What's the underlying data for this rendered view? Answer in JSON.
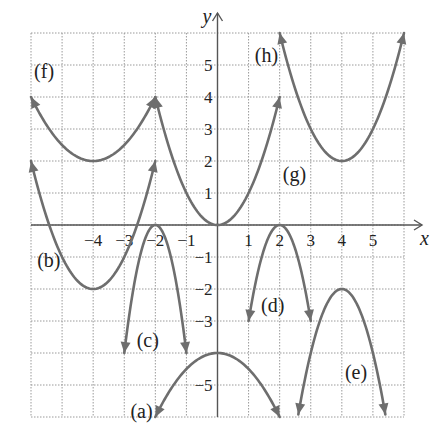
{
  "chart_data": {
    "type": "line",
    "title": "",
    "xlabel": "x",
    "ylabel": "y",
    "xlim": [
      -6,
      6
    ],
    "ylim": [
      -6,
      6
    ],
    "grid": true,
    "x_ticks": [
      "-4",
      "-3",
      "-2",
      "-1",
      "1",
      "2",
      "3",
      "4",
      "5"
    ],
    "x_tick_values": [
      -4,
      -3,
      -2,
      -1,
      1,
      2,
      3,
      4,
      5
    ],
    "y_ticks": [
      "5",
      "4",
      "3",
      "2",
      "1",
      "-1",
      "-2",
      "-3",
      "-5"
    ],
    "y_tick_values": [
      5,
      4,
      3,
      2,
      1,
      -1,
      -2,
      -3,
      -5
    ],
    "series": [
      {
        "name": "(a)",
        "vertex": [
          0,
          -4
        ],
        "a": -0.5,
        "h": 0,
        "k": -4,
        "x_range": [
          -2,
          2
        ],
        "label_pos": [
          -2.8,
          -5.8
        ]
      },
      {
        "name": "(b)",
        "vertex": [
          -4,
          -2
        ],
        "a": 1,
        "h": -4,
        "k": -2,
        "x_range": [
          -6,
          -2
        ],
        "label_pos": [
          -5.8,
          -1.1
        ]
      },
      {
        "name": "(c)",
        "vertex": [
          -2,
          0
        ],
        "a": -4,
        "h": -2,
        "k": 0,
        "x_range": [
          -3,
          -1
        ],
        "label_pos": [
          -2.6,
          -3.6
        ]
      },
      {
        "name": "(d)",
        "vertex": [
          2,
          0
        ],
        "a": -3,
        "h": 2,
        "k": 0,
        "x_range": [
          1,
          3
        ],
        "label_pos": [
          1.4,
          -2.5
        ]
      },
      {
        "name": "(e)",
        "vertex": [
          4,
          -2
        ],
        "a": -2,
        "h": 4,
        "k": -2,
        "x_range": [
          2.6,
          5.4
        ],
        "label_pos": [
          4.1,
          -4.6
        ]
      },
      {
        "name": "(f)",
        "vertex": [
          -4,
          2
        ],
        "a": 0.5,
        "h": -4,
        "k": 2,
        "x_range": [
          -6,
          -2
        ],
        "label_pos": [
          -5.9,
          4.8
        ]
      },
      {
        "name": "(g)",
        "vertex": [
          0,
          0
        ],
        "a": 1,
        "h": 0,
        "k": 0,
        "x_range": [
          -2,
          2
        ],
        "label_pos": [
          2.1,
          1.6
        ]
      },
      {
        "name": "(h)",
        "vertex": [
          4,
          2
        ],
        "a": 1,
        "h": 4,
        "k": 2,
        "x_range": [
          2,
          6
        ],
        "label_pos": [
          1.2,
          5.3
        ]
      }
    ]
  }
}
